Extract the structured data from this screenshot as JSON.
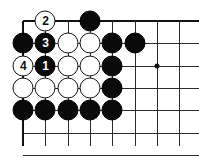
{
  "figure": {
    "type": "go-board-diagram",
    "width": 199,
    "height": 160,
    "background_color": "#ffffff",
    "line_color": "#2b2b2b",
    "edge_color": "#111111"
  },
  "board": {
    "origin_x": 23,
    "origin_y": 21,
    "spacing": 22.3,
    "columns": 9,
    "rows": 7,
    "top_edge_row": 1,
    "left_edge_column": 1,
    "star_points": [
      {
        "name": "star-point-1",
        "col": 7,
        "row": 3
      }
    ]
  },
  "stones": [
    {
      "name": "white-stone-2",
      "color": "white",
      "col": 2,
      "row": 1,
      "label": "2",
      "numbered": true
    },
    {
      "name": "black-stone-d1",
      "color": "black",
      "col": 4,
      "row": 1,
      "label": "",
      "numbered": false
    },
    {
      "name": "black-stone-a2",
      "color": "black",
      "col": 1,
      "row": 2,
      "label": "",
      "numbered": false
    },
    {
      "name": "black-stone-3",
      "color": "black",
      "col": 2,
      "row": 2,
      "label": "3",
      "numbered": true
    },
    {
      "name": "white-stone-c2",
      "color": "white",
      "col": 3,
      "row": 2,
      "label": "",
      "numbered": false
    },
    {
      "name": "white-stone-d2",
      "color": "white",
      "col": 4,
      "row": 2,
      "label": "",
      "numbered": false
    },
    {
      "name": "black-stone-e2",
      "color": "black",
      "col": 5,
      "row": 2,
      "label": "",
      "numbered": false
    },
    {
      "name": "black-stone-f2",
      "color": "black",
      "col": 6,
      "row": 2,
      "label": "",
      "numbered": false
    },
    {
      "name": "white-stone-4",
      "color": "white",
      "col": 1,
      "row": 3,
      "label": "4",
      "numbered": true
    },
    {
      "name": "black-stone-1",
      "color": "black",
      "col": 2,
      "row": 3,
      "label": "1",
      "numbered": true
    },
    {
      "name": "white-stone-c3",
      "color": "white",
      "col": 3,
      "row": 3,
      "label": "",
      "numbered": false
    },
    {
      "name": "white-stone-d3",
      "color": "white",
      "col": 4,
      "row": 3,
      "label": "",
      "numbered": false
    },
    {
      "name": "black-stone-e3",
      "color": "black",
      "col": 5,
      "row": 3,
      "label": "",
      "numbered": false
    },
    {
      "name": "white-stone-a4",
      "color": "white",
      "col": 1,
      "row": 4,
      "label": "",
      "numbered": false
    },
    {
      "name": "white-stone-b4",
      "color": "white",
      "col": 2,
      "row": 4,
      "label": "",
      "numbered": false
    },
    {
      "name": "white-stone-c4",
      "color": "white",
      "col": 3,
      "row": 4,
      "label": "",
      "numbered": false
    },
    {
      "name": "white-stone-d4",
      "color": "white",
      "col": 4,
      "row": 4,
      "label": "",
      "numbered": false
    },
    {
      "name": "black-stone-e4",
      "color": "black",
      "col": 5,
      "row": 4,
      "label": "",
      "numbered": false
    },
    {
      "name": "black-stone-a5",
      "color": "black",
      "col": 1,
      "row": 5,
      "label": "",
      "numbered": false
    },
    {
      "name": "black-stone-b5",
      "color": "black",
      "col": 2,
      "row": 5,
      "label": "",
      "numbered": false
    },
    {
      "name": "black-stone-c5",
      "color": "black",
      "col": 3,
      "row": 5,
      "label": "",
      "numbered": false
    },
    {
      "name": "black-stone-d5",
      "color": "black",
      "col": 4,
      "row": 5,
      "label": "",
      "numbered": false
    },
    {
      "name": "black-stone-e5",
      "color": "black",
      "col": 5,
      "row": 5,
      "label": "",
      "numbered": false
    }
  ]
}
